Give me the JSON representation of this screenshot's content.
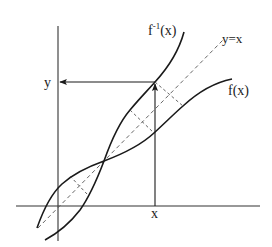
{
  "diagram": {
    "colors": {
      "background": "#ffffff",
      "curve": "#1a1a1a",
      "axis": "#333333",
      "dashed": "#555555",
      "text": "#222222"
    },
    "labels": {
      "inverse_curve": "f",
      "inverse_superscript": "-1",
      "inverse_arg": "(x)",
      "function_curve": "f(x)",
      "identity_line": "y=x",
      "y_value": "y",
      "x_value": "x"
    },
    "elements": [
      {
        "type": "axis",
        "name": "x-axis"
      },
      {
        "type": "axis",
        "name": "y-axis"
      },
      {
        "type": "curve",
        "name": "f(x)"
      },
      {
        "type": "curve",
        "name": "f^-1(x)"
      },
      {
        "type": "dashed-line",
        "name": "y=x"
      },
      {
        "type": "arrow",
        "name": "vertical arrow from x up to f^-1(x)"
      },
      {
        "type": "arrow",
        "name": "horizontal arrow from f^-1(x) to y-axis"
      },
      {
        "type": "dashed-segments",
        "name": "reflection segments perpendicular to y=x",
        "count": 3
      }
    ]
  }
}
